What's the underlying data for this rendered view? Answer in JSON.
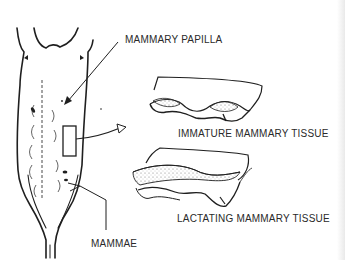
{
  "diagram": {
    "labels": {
      "papilla": "MAMMARY PAPILLA",
      "immature": "IMMATURE MAMMARY TISSUE",
      "lactating": "LACTATING MAMMARY TISSUE",
      "mammae": "MAMMAE"
    },
    "colors": {
      "ink": "#1f1f1f",
      "text": "#2a2a2a",
      "background": "#ffffff",
      "stipple": "#8a8a8a"
    }
  }
}
